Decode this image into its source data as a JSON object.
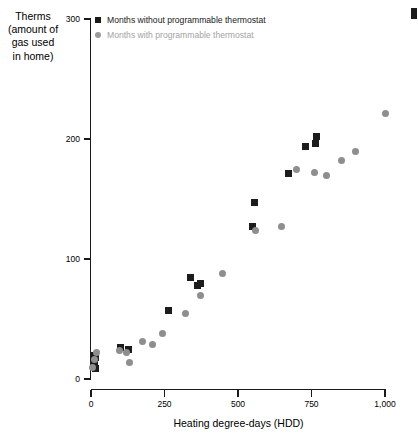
{
  "chart_data": {
    "type": "scatter",
    "title": "",
    "xlabel": "Heating degree-days (HDD)",
    "ylabel": "Therms\n(amount of\ngas used\nin home)",
    "xlim": [
      0,
      1000
    ],
    "ylim": [
      0,
      300
    ],
    "xticks": [
      0,
      250,
      500,
      750,
      1000
    ],
    "xtick_labels": [
      "0",
      "250",
      "500",
      "750",
      "1,000"
    ],
    "yticks": [
      0,
      100,
      200,
      300
    ],
    "ytick_labels": [
      "0",
      "100",
      "200",
      "300"
    ],
    "grid": false,
    "legend_position": "top-left-inside",
    "series": [
      {
        "name": "Months without programmable thermostat",
        "marker": "square",
        "color": "#1c1c1c",
        "points": [
          [
            8,
            14
          ],
          [
            12,
            12
          ],
          [
            10,
            20
          ],
          [
            16,
            18
          ],
          [
            14,
            9
          ],
          [
            100,
            26
          ],
          [
            128,
            25
          ],
          [
            262,
            57
          ],
          [
            340,
            85
          ],
          [
            363,
            78
          ],
          [
            372,
            80
          ],
          [
            548,
            127
          ],
          [
            556,
            147
          ],
          [
            672,
            171
          ],
          [
            728,
            194
          ],
          [
            762,
            196
          ],
          [
            766,
            202
          ]
        ]
      },
      {
        "name": "Months with programmable thermostat",
        "marker": "circle",
        "color": "#8e8e8e",
        "points": [
          [
            6,
            10
          ],
          [
            12,
            16
          ],
          [
            18,
            22
          ],
          [
            96,
            24
          ],
          [
            122,
            22
          ],
          [
            130,
            14
          ],
          [
            176,
            31
          ],
          [
            210,
            29
          ],
          [
            242,
            38
          ],
          [
            320,
            55
          ],
          [
            372,
            70
          ],
          [
            448,
            88
          ],
          [
            560,
            124
          ],
          [
            648,
            127
          ],
          [
            700,
            175
          ],
          [
            760,
            172
          ],
          [
            800,
            170
          ],
          [
            852,
            182
          ],
          [
            900,
            190
          ],
          [
            1000,
            221
          ]
        ]
      }
    ]
  },
  "axis": {
    "y_title": "Therms\n(amount of\ngas used\nin home)",
    "x_title": "Heating degree-days (HDD)",
    "y_labels": [
      "300",
      "200",
      "100",
      "0"
    ],
    "x_labels": [
      "0",
      "250",
      "500",
      "750",
      "1,000"
    ]
  },
  "legend": {
    "entries": [
      {
        "label": "Months without programmable thermostat",
        "marker": "square",
        "color": "#1c1c1c"
      },
      {
        "label": "Months with programmable thermostat",
        "marker": "circle",
        "color": "#9a9a9a"
      }
    ]
  }
}
